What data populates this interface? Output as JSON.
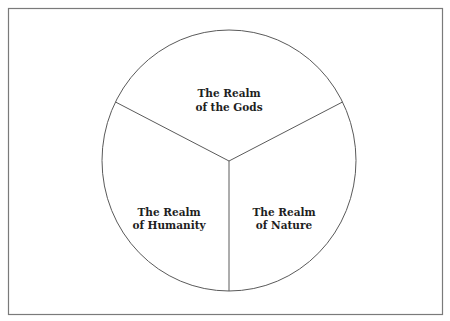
{
  "diagram": {
    "type": "three-part circle",
    "colors": {
      "line": "#5a5a5a",
      "frame": "#7a7a7a",
      "text": "#1e1e1e",
      "background": "#ffffff"
    },
    "sections": [
      {
        "id": "gods",
        "label_line1": "The Realm",
        "label_line2": "of the Gods"
      },
      {
        "id": "humanity",
        "label_line1": "The Realm",
        "label_line2": "of Humanity"
      },
      {
        "id": "nature",
        "label_line1": "The Realm",
        "label_line2": "of Nature"
      }
    ]
  }
}
